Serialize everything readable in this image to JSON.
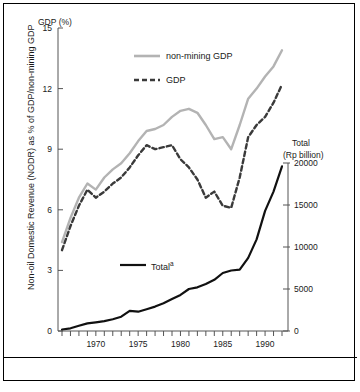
{
  "figure": {
    "left_axis_title": "GDP (%)",
    "left_axis_label": "Non-oil Domestic Revenue (NODR) as % of GDP/non-mining GDP",
    "right_axis_title_line1": "Total",
    "right_axis_title_line2": "(Rp billion)",
    "legend": [
      {
        "label": "non-mining GDP",
        "style": "solid",
        "color": "#b3b3b3"
      },
      {
        "label": "GDP",
        "style": "dashed",
        "color": "#3a3a3a"
      },
      {
        "label": "Total",
        "sup": "a",
        "style": "solid",
        "color": "#111111"
      }
    ]
  },
  "chart_data": {
    "type": "line",
    "title": "",
    "xlabel": "",
    "ylabel": "Non-oil Domestic Revenue (NODR) as % of GDP/non-mining GDP",
    "y2label": "Total (Rp billion)",
    "xlim": [
      1966,
      1992
    ],
    "ylim": [
      0,
      15
    ],
    "y2lim": [
      0,
      20000
    ],
    "yticks": [
      0,
      3,
      6,
      9,
      12,
      15
    ],
    "y2ticks": [
      0,
      5000,
      10000,
      15000,
      20000
    ],
    "xticks": [
      1970,
      1975,
      1980,
      1985,
      1990
    ],
    "xtick_minor_step": 1,
    "grid": false,
    "legend_position": "upper-center",
    "x": [
      1966,
      1967,
      1968,
      1969,
      1970,
      1971,
      1972,
      1973,
      1974,
      1975,
      1976,
      1977,
      1978,
      1979,
      1980,
      1981,
      1982,
      1983,
      1984,
      1985,
      1986,
      1987,
      1988,
      1989,
      1990,
      1991,
      1992
    ],
    "series": [
      {
        "name": "non-mining GDP",
        "axis": "left",
        "style": "solid",
        "color": "#b3b3b3",
        "values": [
          4.4,
          5.6,
          6.6,
          7.3,
          7.0,
          7.6,
          8.0,
          8.3,
          8.8,
          9.4,
          9.9,
          10.0,
          10.2,
          10.6,
          10.9,
          11.0,
          10.8,
          10.2,
          9.5,
          9.6,
          9.0,
          10.2,
          11.5,
          12.0,
          12.6,
          13.1,
          13.9
        ]
      },
      {
        "name": "GDP",
        "axis": "left",
        "style": "dashed",
        "color": "#3a3a3a",
        "values": [
          4.0,
          5.2,
          6.2,
          7.0,
          6.6,
          6.9,
          7.3,
          7.6,
          8.1,
          8.7,
          9.2,
          9.0,
          9.1,
          9.2,
          8.5,
          8.1,
          7.5,
          6.6,
          6.9,
          6.2,
          6.1,
          7.6,
          9.6,
          10.2,
          10.6,
          11.3,
          12.2
        ]
      },
      {
        "name": "Total",
        "axis": "right",
        "style": "solid",
        "color": "#111111",
        "values": [
          180,
          320,
          620,
          900,
          1030,
          1180,
          1400,
          1700,
          2400,
          2300,
          2600,
          2900,
          3300,
          3800,
          4300,
          5000,
          5200,
          5600,
          6100,
          6900,
          7200,
          7300,
          8700,
          10900,
          14300,
          16600,
          19600
        ]
      }
    ]
  }
}
